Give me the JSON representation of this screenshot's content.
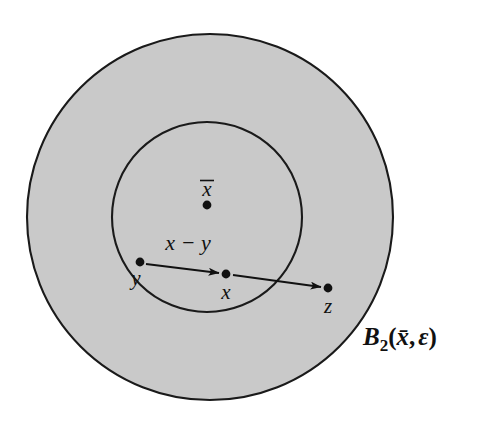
{
  "figure": {
    "background_color": "#ffffff",
    "fill_color": "#c9c9c9",
    "stroke_color": "#1a1a1a",
    "dot_color": "#111111"
  },
  "regions": {
    "outer_ball": {
      "name": "outer-disk",
      "label": "B₂(x̄, ε)",
      "label_base": "B",
      "label_subscript": "2",
      "label_open_paren": "(",
      "label_center_var": "x̄",
      "label_comma": ",",
      "label_radius_var": "ε",
      "label_close_paren": ")",
      "cx": 210,
      "cy": 217,
      "r": 183
    },
    "inner_ball": {
      "name": "inner-disk",
      "cx": 207,
      "cy": 217,
      "r": 95
    }
  },
  "points": [
    {
      "id": "xbar",
      "label": "x̄",
      "base": "x",
      "has_overbar": true,
      "cx": 207,
      "cy": 205,
      "label_x": 207,
      "label_y": 196,
      "label_pos": "above"
    },
    {
      "id": "y",
      "label": "y",
      "base": "y",
      "has_overbar": false,
      "cx": 140,
      "cy": 262,
      "label_x": 136,
      "label_y": 285,
      "label_pos": "below-left"
    },
    {
      "id": "x",
      "label": "x",
      "base": "x",
      "has_overbar": false,
      "cx": 226,
      "cy": 274,
      "label_x": 226,
      "label_y": 299,
      "label_pos": "below"
    },
    {
      "id": "z",
      "label": "z",
      "base": "z",
      "has_overbar": false,
      "cx": 328,
      "cy": 288,
      "label_x": 328,
      "label_y": 313,
      "label_pos": "below"
    }
  ],
  "arrows": [
    {
      "id": "y-to-x",
      "label": "x − y",
      "from": "y",
      "to": "x",
      "x1": 146,
      "y1": 264,
      "x2": 219,
      "y2": 273
    },
    {
      "id": "x-to-z",
      "label": "",
      "from": "x",
      "to": "z",
      "x1": 233,
      "y1": 275,
      "x2": 321,
      "y2": 287
    }
  ],
  "vector_label": {
    "text": "x − y",
    "x": 188,
    "y": 250
  }
}
